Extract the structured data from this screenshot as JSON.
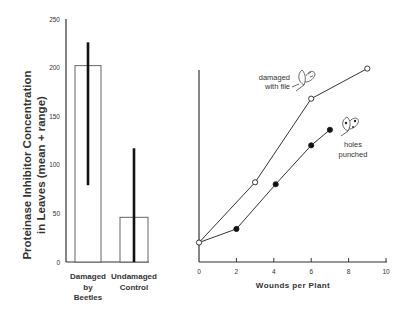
{
  "chart_data": [
    {
      "type": "bar",
      "title": "",
      "ylabel": "Proteinase Inhibitor Concentration in Leaves (mean + range)",
      "ylabel_lines": [
        "Proteinase Inhibitor Concentration",
        "in Leaves (mean + range)"
      ],
      "xlabel": "",
      "ylim": [
        0,
        250
      ],
      "yticks": [
        0,
        50,
        100,
        150,
        200,
        250
      ],
      "categories": [
        "Damaged by Beetles",
        "Undamaged Control"
      ],
      "category_lines": [
        [
          "Damaged",
          "by",
          "Beetles"
        ],
        [
          "Undamaged",
          "Control"
        ]
      ],
      "values": [
        202,
        46
      ],
      "range_low": [
        79,
        0
      ],
      "range_high": [
        226,
        117
      ],
      "grid": false
    },
    {
      "type": "line",
      "title": "",
      "xlabel": "Wounds per Plant",
      "ylabel": "",
      "xlim": [
        0,
        10
      ],
      "xticks": [
        0,
        2,
        4,
        6,
        8,
        10
      ],
      "ylim": [
        0,
        250
      ],
      "y_tick_labels_shown": false,
      "grid": false,
      "series": [
        {
          "name": "damaged with file",
          "label_lines": [
            "damaged",
            "with file"
          ],
          "marker": "open-circle",
          "x": [
            0,
            3,
            6,
            9
          ],
          "y": [
            20,
            82,
            168,
            199
          ]
        },
        {
          "name": "holes punched",
          "label_lines": [
            "holes",
            "punched"
          ],
          "marker": "filled-circle",
          "x": [
            0,
            2,
            4.1,
            6,
            7
          ],
          "y": [
            20,
            34,
            80,
            120,
            136
          ]
        }
      ]
    }
  ]
}
